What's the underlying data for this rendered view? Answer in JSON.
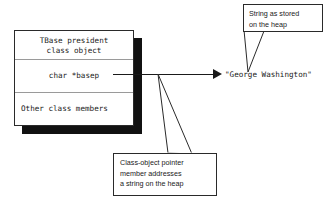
{
  "diagram": {
    "colors": {
      "background": "#ffffff",
      "stroke": "#2a2a2a",
      "shadow": "#111111",
      "divider": "#9a9a9a",
      "text": "#1a1a1a"
    }
  },
  "class_object": {
    "rows": [
      {
        "text": "TBase president\nclass object",
        "name": "class-object-title"
      },
      {
        "text": "char *basep",
        "name": "pointer-member"
      },
      {
        "text": "Other class members",
        "name": "other-members"
      }
    ]
  },
  "heap": {
    "string_value": "\"George Washington\""
  },
  "callouts": [
    {
      "id": "heap-string-callout",
      "text": "String as stored\non the heap"
    },
    {
      "id": "pointer-member-callout",
      "text": "Class-object pointer\nmember addresses\na string on the heap"
    }
  ]
}
